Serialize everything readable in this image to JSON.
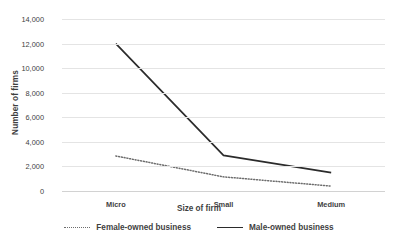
{
  "chart_data": {
    "type": "line",
    "title": "",
    "xlabel": "Size of firm",
    "ylabel": "Number of firms",
    "categories": [
      "Micro",
      "Small",
      "Medium"
    ],
    "series": [
      {
        "name": "Female-owned business",
        "style": "dotted",
        "color": "#6d6d6d",
        "values": [
          2850,
          1150,
          400
        ]
      },
      {
        "name": "Male-owned business",
        "style": "solid",
        "color": "#2b2b2b",
        "values": [
          12000,
          2900,
          1500
        ]
      }
    ],
    "ylim": [
      0,
      14000
    ],
    "ytick_labels": [
      "0",
      "2,000",
      "4,000",
      "6,000",
      "8,000",
      "10,000",
      "12,000",
      "14,000"
    ],
    "ytick_values": [
      0,
      2000,
      4000,
      6000,
      8000,
      10000,
      12000,
      14000
    ],
    "grid": true,
    "legend_position": "bottom"
  },
  "legend": {
    "items": [
      {
        "label": "Female-owned business",
        "marker": "dotted-line-swatch"
      },
      {
        "label": "Male-owned business",
        "marker": "solid-line-swatch"
      }
    ]
  },
  "axes": {
    "y_title": "Number of firms",
    "x_title": "Size of firm"
  }
}
